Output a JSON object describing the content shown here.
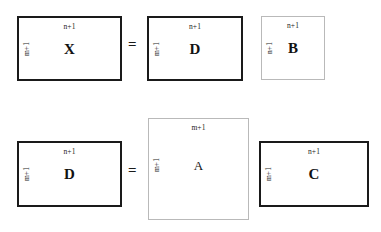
{
  "diagram": {
    "type": "matrix-dimension-diagram",
    "equations": [
      {
        "id": "equation-top",
        "operator": "=",
        "terms": [
          {
            "id": "matrix-x",
            "symbol": "X",
            "rows_label": "m+1",
            "cols_label": "n+1",
            "border": "dark"
          },
          {
            "id": "matrix-d-top",
            "symbol": "D",
            "rows_label": "m+1",
            "cols_label": "n+1",
            "border": "dark"
          },
          {
            "id": "matrix-b",
            "symbol": "B",
            "rows_label": "n+1",
            "cols_label": "n+1",
            "border": "light"
          }
        ]
      },
      {
        "id": "equation-bottom",
        "operator": "=",
        "terms": [
          {
            "id": "matrix-d-bottom",
            "symbol": "D",
            "rows_label": "m+1",
            "cols_label": "n+1",
            "border": "dark"
          },
          {
            "id": "matrix-a",
            "symbol": "A",
            "rows_label": "m+1",
            "cols_label": "m+1",
            "border": "light"
          },
          {
            "id": "matrix-c",
            "symbol": "C",
            "rows_label": "m+1",
            "cols_label": "n+1",
            "border": "dark"
          }
        ]
      }
    ]
  },
  "colors": {
    "ink": "#1a1a1a",
    "light_border": "#b9b9b9",
    "background": "#ffffff"
  }
}
